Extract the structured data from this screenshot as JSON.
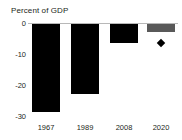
{
  "chart_data": {
    "type": "bar",
    "title": "Percent of GDP",
    "xlabel": "",
    "ylabel": "",
    "categories": [
      "1967",
      "1989",
      "2008",
      "2020"
    ],
    "values": [
      -28.5,
      -22.5,
      -6.0,
      -2.5
    ],
    "bar_colors": [
      "#000000",
      "#000000",
      "#000000",
      "#595959"
    ],
    "ylim": [
      -30,
      0
    ],
    "yticks": [
      0,
      -10,
      -20,
      -30
    ],
    "ytick_labels": [
      "0",
      "-10",
      "-20",
      "-30"
    ],
    "grid": false,
    "legend": "none",
    "markers": [
      {
        "category": "2020",
        "value": -6.0,
        "shape": "diamond",
        "color": "#000000"
      }
    ],
    "zero_line_color": "#b8b8b8",
    "axis_text_color": "#231f20"
  }
}
